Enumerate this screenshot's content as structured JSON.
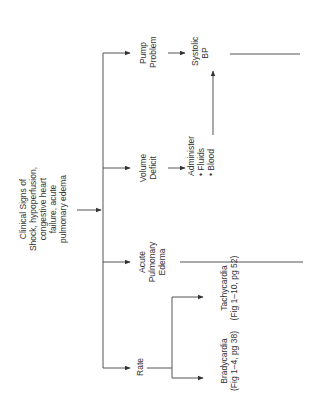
{
  "diagram": {
    "orientation": "rotated-90-ccw",
    "root": {
      "lines": [
        "Clinical Signs of",
        "Shock, hypoperfusion,",
        "congestive heart",
        "failure, acute",
        "pulmonary edema"
      ]
    },
    "branches": [
      {
        "id": "pump",
        "lines": [
          "Pump",
          "Problem"
        ],
        "next": {
          "lines": [
            "Systolic",
            "BP"
          ]
        }
      },
      {
        "id": "volume",
        "lines": [
          "Volume",
          "Deficit"
        ],
        "next": {
          "lines": [
            "Administer",
            "• Fluids",
            "• Blood"
          ],
          "leads_to": "Systolic BP"
        }
      },
      {
        "id": "acute",
        "lines": [
          "Acute",
          "Pulmonary",
          "Edema"
        ]
      },
      {
        "id": "rate",
        "lines": [
          "Rate"
        ],
        "children": [
          {
            "id": "bradycardia",
            "lines": [
              "Bradycardia",
              "(Fig 1–4, pg 38)"
            ]
          },
          {
            "id": "tachycardia",
            "lines": [
              "Tachycardia",
              "(Fig 1–10, pg 52)"
            ]
          }
        ]
      }
    ],
    "line_color": "#555555"
  }
}
